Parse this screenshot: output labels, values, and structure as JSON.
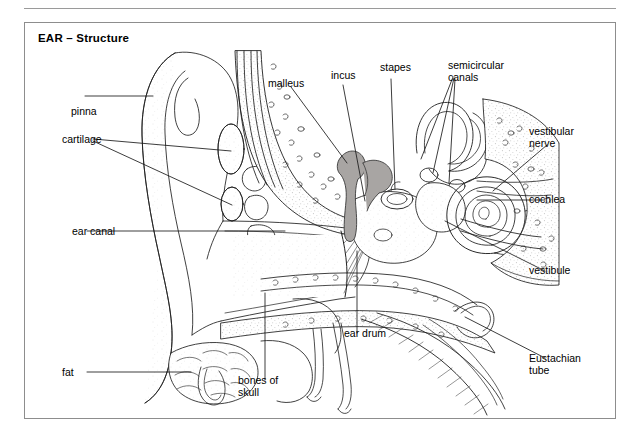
{
  "figure": {
    "title": "EAR – Structure",
    "background_color": "#ffffff",
    "frame_color": "#8d8d8d",
    "rule_color": "#9a9a9a",
    "ink_color": "#1a1a1a",
    "ossicle_fill": "#a8a5a3",
    "stipple_color": "#b9b9b9"
  },
  "diagram": {
    "type": "anatomical-cross-section",
    "labels": [
      {
        "id": "pinna",
        "text": "pinna",
        "x": 46,
        "y": 88,
        "align": "left"
      },
      {
        "id": "cartilage",
        "text": "cartilage",
        "x": 37,
        "y": 131,
        "align": "left"
      },
      {
        "id": "ear-canal",
        "text": "ear canal",
        "x": 47,
        "y": 222,
        "align": "left"
      },
      {
        "id": "fat",
        "text": "fat",
        "x": 87,
        "y": 363,
        "align": "left"
      },
      {
        "id": "bones-of-skull",
        "text": "bones of\nskull",
        "x": 236,
        "y": 370,
        "align": "left"
      },
      {
        "id": "malleus",
        "text": "malleus",
        "x": 267,
        "y": 74,
        "align": "left"
      },
      {
        "id": "incus",
        "text": "incus",
        "x": 330,
        "y": 68,
        "align": "left"
      },
      {
        "id": "stapes",
        "text": "stapes",
        "x": 379,
        "y": 60,
        "align": "left"
      },
      {
        "id": "semicircular-canals",
        "text": "semicircular\ncanals",
        "x": 447,
        "y": 58,
        "align": "left"
      },
      {
        "id": "vestibular-nerve",
        "text": "vestibular\nnerve",
        "x": 528,
        "y": 124,
        "align": "left"
      },
      {
        "id": "cochlea",
        "text": "cochlea",
        "x": 528,
        "y": 190,
        "align": "left"
      },
      {
        "id": "vestibule",
        "text": "vestibule",
        "x": 528,
        "y": 261,
        "align": "left"
      },
      {
        "id": "ear-drum",
        "text": "ear drum",
        "x": 343,
        "y": 330,
        "align": "left"
      },
      {
        "id": "eustachian-tube",
        "text": "Eustachian\ntube",
        "x": 528,
        "y": 350,
        "align": "left"
      }
    ]
  }
}
